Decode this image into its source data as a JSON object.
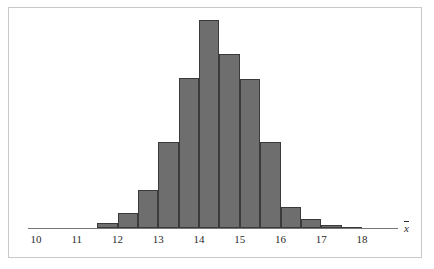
{
  "figure": {
    "background_color": "#ffffff",
    "frame_color": "#c9c9c9",
    "axis_color": "#777777"
  },
  "axis": {
    "title": "x",
    "title_overbar": true,
    "tick_labels": [
      "10",
      "11",
      "12",
      "13",
      "14",
      "15",
      "16",
      "17",
      "18"
    ]
  },
  "chart_data": {
    "type": "bar",
    "title": "",
    "subtitle": "",
    "xlabel": "x̄",
    "ylabel": "",
    "grid": false,
    "legend": null,
    "bin_width": 0.5,
    "xlim": [
      9.6,
      18.6
    ],
    "ylim": [
      0,
      1
    ],
    "xticks": [
      10,
      11,
      12,
      13,
      14,
      15,
      16,
      17,
      18
    ],
    "xtick_labels": [
      "10",
      "11",
      "12",
      "13",
      "14",
      "15",
      "16",
      "17",
      "18"
    ],
    "bar_fill_color": "#6e6e6e",
    "bar_edge_color": "#3a3a3a",
    "bin_edges": [
      11.5,
      12.0,
      12.5,
      13.0,
      13.5,
      14.0,
      14.5,
      15.0,
      15.5,
      16.0,
      16.5,
      17.0,
      17.5,
      18.0
    ],
    "categories": [
      "11.5-12.0",
      "12.0-12.5",
      "12.5-13.0",
      "13.0-13.5",
      "13.5-14.0",
      "14.0-14.5",
      "14.5-15.0",
      "15.0-15.5",
      "15.5-16.0",
      "16.0-16.5",
      "16.5-17.0",
      "17.0-17.5",
      "17.5-18.0"
    ],
    "values": [
      0.024,
      0.072,
      0.183,
      0.414,
      0.721,
      1.0,
      0.837,
      0.716,
      0.414,
      0.101,
      0.043,
      0.014,
      0.005
    ],
    "bars": [
      {
        "x0": 11.5,
        "x1": 12.0,
        "height": 0.024
      },
      {
        "x0": 12.0,
        "x1": 12.5,
        "height": 0.072
      },
      {
        "x0": 12.5,
        "x1": 13.0,
        "height": 0.183
      },
      {
        "x0": 13.0,
        "x1": 13.5,
        "height": 0.414
      },
      {
        "x0": 13.5,
        "x1": 14.0,
        "height": 0.721
      },
      {
        "x0": 14.0,
        "x1": 14.5,
        "height": 1.0
      },
      {
        "x0": 14.5,
        "x1": 15.0,
        "height": 0.837
      },
      {
        "x0": 15.0,
        "x1": 15.5,
        "height": 0.716
      },
      {
        "x0": 15.5,
        "x1": 16.0,
        "height": 0.414
      },
      {
        "x0": 16.0,
        "x1": 16.5,
        "height": 0.101
      },
      {
        "x0": 16.5,
        "x1": 17.0,
        "height": 0.043
      },
      {
        "x0": 17.0,
        "x1": 17.5,
        "height": 0.014
      },
      {
        "x0": 17.5,
        "x1": 18.0,
        "height": 0.005
      }
    ]
  },
  "layout": {
    "x_at_10_px": 36,
    "px_per_unit": 40.75,
    "baseline_y_px": 228,
    "max_bar_top_y_px": 20,
    "axis_line_x0_px": 28,
    "axis_line_x1_px": 398,
    "tick_label_y_px": 233,
    "axis_title_x_px": 404,
    "axis_title_y_px": 221
  }
}
